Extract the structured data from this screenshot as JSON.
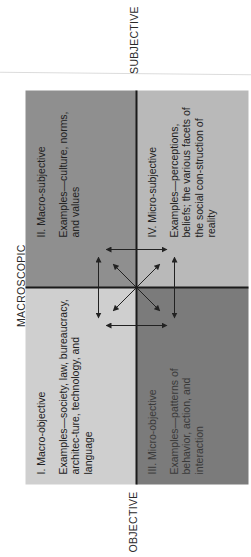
{
  "axes": {
    "top_label": "MACROSCOPIC",
    "left_label": "OBJECTIVE",
    "right_label": "SUBJECTIVE"
  },
  "quadrants": [
    {
      "id": "I",
      "title": "I. Macro-objective",
      "description": "Examples—society, law, bureaucracy, architec-ture, technology, and language",
      "color": "#cfcfcf"
    },
    {
      "id": "II",
      "title": "II. Macro-subjective",
      "description": "Examples—culture, norms, and values",
      "color": "#8f8f8f"
    },
    {
      "id": "III",
      "title": "III. Micro-objective",
      "description": "Examples—patterns of behavior, action, and interaction",
      "color": "#7b7b7b"
    },
    {
      "id": "IV",
      "title": "IV. Micro-subjective",
      "description": "Examples—perceptions, beliefs; the various facets of the social con-struction of reality",
      "color": "#b9b9b9"
    }
  ],
  "center_graphic": "bidirectional-arrows-connecting-all-quadrants",
  "orientation": "rotated-90-ccw"
}
